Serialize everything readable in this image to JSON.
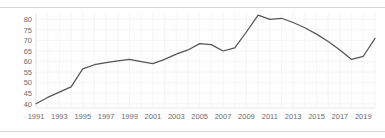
{
  "corner_note": "",
  "chart_data": {
    "type": "line",
    "title": "",
    "subtitle": "",
    "xlabel": "",
    "ylabel": "",
    "grid": true,
    "legend": false,
    "legend_position": "none",
    "line_color": "#555558",
    "grid_color": "#f2f2f4",
    "axis_color": "#e6e6e8",
    "tick_label_color": "#6d6d6d",
    "xlim": [
      1991,
      2020
    ],
    "ylim": [
      38,
      83
    ],
    "yticks": [
      40,
      45,
      50,
      55,
      60,
      65,
      70,
      75,
      80
    ],
    "ytick_labels": [
      "40",
      "45",
      "50",
      "55",
      "60",
      "65",
      "70",
      "75",
      "80"
    ],
    "xticks": [
      1991,
      1993,
      1995,
      1997,
      1999,
      2001,
      2003,
      2005,
      2007,
      2009,
      2011,
      2013,
      2015,
      2017,
      2019
    ],
    "xtick_labels": [
      "1991",
      "1993",
      "1995",
      "1997",
      "1999",
      "2001",
      "2003",
      "2005",
      "2007",
      "2009",
      "2011",
      "2013",
      "2015",
      "2017",
      "2019"
    ],
    "x": [
      1991,
      1992,
      1993,
      1994,
      1995,
      1996,
      1997,
      1998,
      1999,
      2000,
      2001,
      2002,
      2003,
      2004,
      2005,
      2006,
      2007,
      2008,
      2009,
      2010,
      2011,
      2012,
      2013,
      2014,
      2015,
      2016,
      2017,
      2018,
      2019,
      2020
    ],
    "values": [
      40,
      43,
      45.5,
      48,
      56.5,
      58.5,
      59.5,
      60.3,
      61,
      60,
      59,
      61,
      63.5,
      65.5,
      68.5,
      68,
      65,
      66.5,
      74,
      82,
      80,
      80.5,
      78.5,
      76,
      73,
      69.5,
      65.5,
      61,
      62.5,
      71
    ]
  }
}
